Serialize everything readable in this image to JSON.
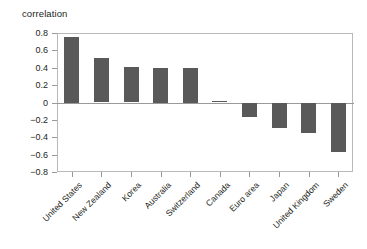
{
  "chart_data": {
    "type": "bar",
    "title": "correlation",
    "xlabel": "",
    "ylabel": "",
    "categories": [
      "United States",
      "New Zealand",
      "Korea",
      "Australia",
      "Switzerland",
      "Canada",
      "Euro area",
      "Japan",
      "United Kingdom",
      "Sweden"
    ],
    "values": [
      0.75,
      0.51,
      0.41,
      0.4,
      0.4,
      0.02,
      -0.17,
      -0.29,
      -0.35,
      -0.57
    ],
    "ylim": [
      -0.8,
      0.8
    ],
    "ytick_labels": [
      "0.8",
      "0.6",
      "0.4",
      "0.2",
      "0",
      "−0.2",
      "−0.4",
      "−0.6",
      "−0.8"
    ],
    "ytick_values": [
      0.8,
      0.6,
      0.4,
      0.2,
      0,
      -0.2,
      -0.4,
      -0.6,
      -0.8
    ],
    "grid": false,
    "legend": "none",
    "bar_color": "#595959",
    "frame_color": "#b9b9b9",
    "axis_color": "#9a9a9a",
    "text_color": "#231f20"
  }
}
